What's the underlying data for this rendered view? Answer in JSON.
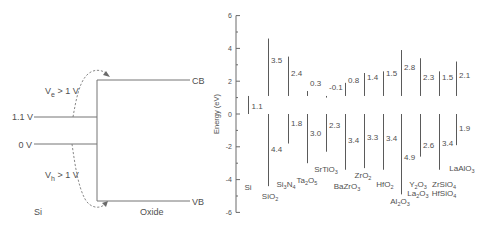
{
  "left_diagram": {
    "ve_label": {
      "main": "V",
      "sub": "e",
      "rest": " > 1 V"
    },
    "vh_label": {
      "main": "V",
      "sub": "h",
      "rest": " > 1 V"
    },
    "level_high": "1.1 V",
    "level_low": "0 V",
    "cb": "CB",
    "vb": "VB",
    "si": "Si",
    "oxide": "Oxide"
  },
  "chart_data": {
    "type": "bar",
    "subtype": "floating range bars (band offsets relative to Si)",
    "title": "",
    "xlabel": "",
    "ylabel": "Energy (eV)",
    "ylim": [
      -6,
      6
    ],
    "yticks": [
      6,
      4,
      2,
      0,
      -2,
      -4,
      -6
    ],
    "minor_ticks": [
      5,
      3,
      1,
      -1,
      -3,
      -5
    ],
    "grid": false,
    "legend": null,
    "reference": {
      "material": "Si",
      "band_gap": 1.1,
      "valence_band": 0
    },
    "categories": [
      "Si",
      "SiO2",
      "Si3N4",
      "Ta2O5",
      "SrTiO3",
      "BaZrO3",
      "ZrO2",
      "HfO2",
      "Al2O3",
      "Y2O3 / La2O3",
      "ZrSiO4 / HfSiO4",
      "LaAlO3"
    ],
    "series": [
      {
        "name": "Conduction band offset (eV)",
        "values": [
          null,
          3.5,
          2.4,
          0.3,
          -0.1,
          0.8,
          1.4,
          1.5,
          2.8,
          2.3,
          1.5,
          2.1
        ]
      },
      {
        "name": "Valence band offset (eV)",
        "values": [
          null,
          4.4,
          1.8,
          3.0,
          2.3,
          3.4,
          3.3,
          3.4,
          4.9,
          2.6,
          3.4,
          1.9
        ]
      }
    ],
    "materials": [
      {
        "name": "Si",
        "gap": 1.1,
        "gap_label": "1.1",
        "label_lines": [
          [
            [
              "Si",
              ""
            ]
          ]
        ]
      },
      {
        "name": "SiO2",
        "cb": 3.5,
        "cb_label": "3.5",
        "vb": 4.4,
        "vb_label": "4.4",
        "label_lines": [
          [
            [
              "SiO",
              "2"
            ]
          ]
        ]
      },
      {
        "name": "Si3N4",
        "cb": 2.4,
        "cb_label": "2.4",
        "vb": 1.8,
        "vb_label": "1.8",
        "label_lines": [
          [
            [
              "Si",
              "3"
            ],
            [
              "N",
              "4"
            ]
          ]
        ]
      },
      {
        "name": "Ta2O5",
        "cb": 0.3,
        "cb_label": "0.3",
        "vb": 3.0,
        "vb_label": "3.0",
        "label_lines": [
          [
            [
              "Ta",
              "2"
            ],
            [
              "O",
              "5"
            ]
          ]
        ]
      },
      {
        "name": "SrTiO3",
        "cb": -0.1,
        "cb_label": "-0.1",
        "vb": 2.3,
        "vb_label": "2.3",
        "label_lines": [
          [
            [
              "SrTiO",
              "3"
            ]
          ]
        ]
      },
      {
        "name": "BaZrO3",
        "cb": 0.8,
        "cb_label": "0.8",
        "vb": 3.4,
        "vb_label": "3.4",
        "label_lines": [
          [
            [
              "BaZrO",
              "3"
            ]
          ]
        ]
      },
      {
        "name": "ZrO2",
        "cb": 1.4,
        "cb_label": "1.4",
        "vb": 3.3,
        "vb_label": "3.3",
        "label_lines": [
          [
            [
              "ZrO",
              "2"
            ]
          ]
        ]
      },
      {
        "name": "HfO2",
        "cb": 1.5,
        "cb_label": "1.5",
        "vb": 3.4,
        "vb_label": "3.4",
        "label_lines": [
          [
            [
              "HfO",
              "2"
            ]
          ]
        ]
      },
      {
        "name": "Al2O3",
        "cb": 2.8,
        "cb_label": "2.8",
        "vb": 4.9,
        "vb_label": "4.9",
        "label_lines": [
          [
            [
              "Al",
              "2"
            ],
            [
              "O",
              "3"
            ]
          ]
        ]
      },
      {
        "name": "Y2O3 / La2O3",
        "cb": 2.3,
        "cb_label": "2.3",
        "vb": 2.6,
        "vb_label": "2.6",
        "label_lines": [
          [
            [
              "Y",
              "2"
            ],
            [
              "O",
              "3"
            ]
          ],
          [
            [
              "La",
              "2"
            ],
            [
              "O",
              "3"
            ]
          ]
        ]
      },
      {
        "name": "ZrSiO4 / HfSiO4",
        "cb": 1.5,
        "cb_label": "1.5",
        "vb": 3.4,
        "vb_label": "3.4",
        "label_lines": [
          [
            [
              "ZrSiO",
              "4"
            ]
          ],
          [
            [
              "HfSiO",
              "4"
            ]
          ]
        ]
      },
      {
        "name": "LaAlO3",
        "cb": 2.1,
        "cb_label": "2.1",
        "vb": 1.9,
        "vb_label": "1.9",
        "label_lines": [
          [
            [
              "LaAlO",
              "3"
            ]
          ]
        ]
      }
    ]
  }
}
